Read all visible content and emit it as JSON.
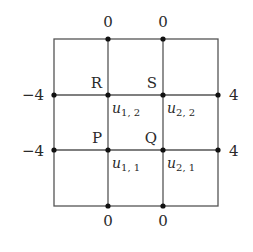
{
  "diagram": {
    "type": "grid-boundary-value",
    "grid": {
      "x_lines": [
        54,
        108,
        163,
        218
      ],
      "y_lines": [
        39,
        95,
        150,
        206
      ],
      "line_color": "#555555"
    },
    "nodes": {
      "R": {
        "label": "R",
        "x": 108,
        "y": 95
      },
      "S": {
        "label": "S",
        "x": 163,
        "y": 95
      },
      "P": {
        "label": "P",
        "x": 108,
        "y": 150
      },
      "Q": {
        "label": "Q",
        "x": 163,
        "y": 150
      }
    },
    "unknowns": {
      "u12": {
        "base": "u",
        "sub": "1, 2"
      },
      "u22": {
        "base": "u",
        "sub": "2, 2"
      },
      "u11": {
        "base": "u",
        "sub": "1, 1"
      },
      "u21": {
        "base": "u",
        "sub": "2, 1"
      }
    },
    "boundary_values": {
      "top_left": "0",
      "top_right": "0",
      "bottom_left": "0",
      "bottom_right": "0",
      "left_upper": "−4",
      "left_lower": "−4",
      "right_upper": "4",
      "right_lower": "4"
    }
  }
}
